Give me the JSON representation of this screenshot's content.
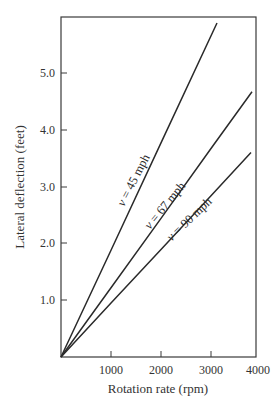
{
  "chart_data": {
    "type": "line",
    "title": "",
    "xlabel": "Rotation rate (rpm)",
    "ylabel": "Lateral deflection (feet)",
    "xlim": [
      0,
      4000
    ],
    "ylim": [
      0,
      6.0
    ],
    "grid": false,
    "legend_position": "inline labels along lines",
    "x_ticks": [
      1000,
      2000,
      3000,
      4000
    ],
    "x_tick_labels": [
      "1000",
      "2000",
      "3000",
      "4000"
    ],
    "y_ticks": [
      1.0,
      2.0,
      3.0,
      4.0,
      5.0
    ],
    "y_tick_labels": [
      "1.0",
      "2.0",
      "3.0",
      "4.0",
      "5.0"
    ],
    "series": [
      {
        "name": "v = 45 mph",
        "var": "v",
        "label_rest": " = 45 mph",
        "x": [
          0,
          1000,
          2000,
          3120
        ],
        "y": [
          0,
          1.88,
          3.77,
          5.88
        ]
      },
      {
        "name": "v = 67 mph",
        "var": "v",
        "label_rest": " = 67 mph",
        "x": [
          0,
          1000,
          2000,
          3000,
          3820
        ],
        "y": [
          0,
          1.22,
          2.44,
          3.67,
          4.67
        ]
      },
      {
        "name": "v = 90 mph",
        "var": "v",
        "label_rest": " = 90 mph",
        "x": [
          0,
          1000,
          2000,
          3000,
          3800
        ],
        "y": [
          0,
          0.95,
          1.89,
          2.84,
          3.6
        ]
      }
    ]
  }
}
